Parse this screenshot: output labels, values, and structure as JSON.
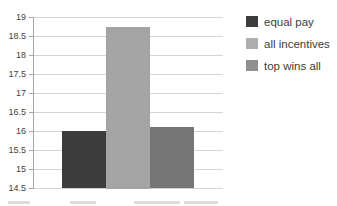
{
  "chart_data": {
    "type": "bar",
    "title": "",
    "xlabel": "",
    "ylabel": "",
    "categories": [
      "equal pay",
      "all incentives",
      "top wins all"
    ],
    "values": [
      16.0,
      18.75,
      16.1
    ],
    "series_colors": [
      "#3c3c3c",
      "#a4a4a4",
      "#757575"
    ],
    "ylim": [
      14.5,
      19
    ],
    "ytick_step": 0.5,
    "ytick_labels": [
      "19",
      "18.5",
      "18",
      "17.5",
      "17",
      "16.5",
      "16",
      "15.5",
      "15",
      "14.5"
    ],
    "grid": true,
    "legend_position": "right",
    "legend": [
      {
        "label": "equal pay",
        "color": "#3c3c3c"
      },
      {
        "label": "all incentives",
        "color": "#aeaeae"
      },
      {
        "label": "top wins all",
        "color": "#8f8f8f"
      }
    ]
  },
  "colors": {
    "background": "#ffffff",
    "gridline": "#d4d4d4",
    "axis": "#a6a6a6",
    "tick_label": "#424242",
    "legend_text": "#3b3b3b"
  }
}
